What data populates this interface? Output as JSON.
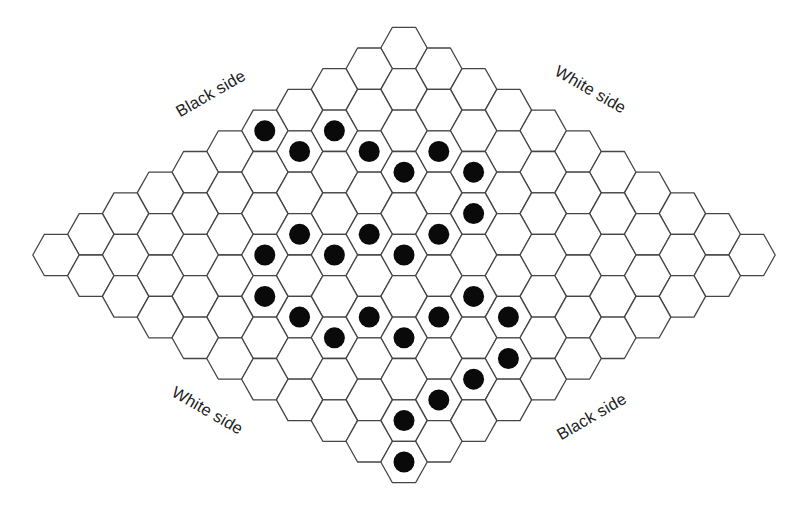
{
  "diagram": {
    "type": "hex-board",
    "board_size": 11,
    "geometry": {
      "top_cell_center": [
        404,
        48
      ],
      "step_dx": 34.8,
      "step_dy": 20.7,
      "hex_radius": 23.2,
      "hex_height": 41.4,
      "stone_radius": 10.5
    },
    "colors": {
      "background": "#ffffff",
      "grid_line": "#454545",
      "stone": "#0a0a0a",
      "label_text": "#222222"
    },
    "labels": [
      {
        "id": "top-left",
        "text": "Black side",
        "x": 210,
        "y": 93,
        "rotate": -30
      },
      {
        "id": "top-right",
        "text": "White side",
        "x": 590,
        "y": 89,
        "rotate": 30
      },
      {
        "id": "bottom-left",
        "text": "White side",
        "x": 207,
        "y": 410,
        "rotate": 30
      },
      {
        "id": "bottom-right",
        "text": "Black side",
        "x": 591,
        "y": 416,
        "rotate": -30
      }
    ],
    "stones": [
      {
        "color": "black",
        "i": 4,
        "j": 0
      },
      {
        "color": "black",
        "i": 4,
        "j": 1
      },
      {
        "color": "black",
        "i": 3,
        "j": 1
      },
      {
        "color": "black",
        "i": 3,
        "j": 2
      },
      {
        "color": "black",
        "i": 2,
        "j": 3
      },
      {
        "color": "black",
        "i": 3,
        "j": 3
      },
      {
        "color": "black",
        "i": 2,
        "j": 4
      },
      {
        "color": "black",
        "i": 3,
        "j": 5
      },
      {
        "color": "black",
        "i": 6,
        "j": 3
      },
      {
        "color": "black",
        "i": 5,
        "j": 4
      },
      {
        "color": "black",
        "i": 4,
        "j": 5
      },
      {
        "color": "black",
        "i": 7,
        "j": 3
      },
      {
        "color": "black",
        "i": 6,
        "j": 4
      },
      {
        "color": "black",
        "i": 5,
        "j": 5
      },
      {
        "color": "black",
        "i": 8,
        "j": 4
      },
      {
        "color": "black",
        "i": 5,
        "j": 7
      },
      {
        "color": "black",
        "i": 8,
        "j": 5
      },
      {
        "color": "black",
        "i": 7,
        "j": 6
      },
      {
        "color": "black",
        "i": 6,
        "j": 7
      },
      {
        "color": "black",
        "i": 5,
        "j": 8
      },
      {
        "color": "black",
        "i": 8,
        "j": 6
      },
      {
        "color": "black",
        "i": 7,
        "j": 7
      },
      {
        "color": "black",
        "i": 6,
        "j": 9
      },
      {
        "color": "black",
        "i": 7,
        "j": 9
      },
      {
        "color": "black",
        "i": 8,
        "j": 9
      },
      {
        "color": "black",
        "i": 9,
        "j": 9
      },
      {
        "color": "black",
        "i": 10,
        "j": 10
      }
    ]
  }
}
